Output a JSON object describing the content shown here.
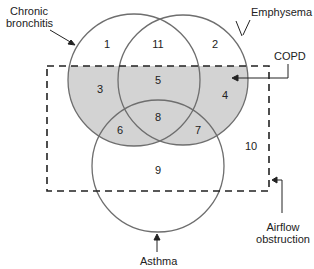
{
  "diagram": {
    "type": "venn",
    "sets": [
      {
        "name": "chronic-bronchitis",
        "label_line1": "Chronic",
        "label_line2": "bronchitis"
      },
      {
        "name": "emphysema",
        "label": "Emphysema"
      },
      {
        "name": "asthma",
        "label": "Asthma"
      }
    ],
    "labels": {
      "chronic_l1": "Chronic",
      "chronic_l2": "bronchitis",
      "emphysema": "Emphysema",
      "copd": "COPD",
      "airflow_l1": "Airflow",
      "airflow_l2": "obstruction",
      "asthma": "Asthma"
    },
    "regions": [
      "1",
      "2",
      "3",
      "4",
      "5",
      "6",
      "7",
      "8",
      "9",
      "10",
      "11"
    ],
    "colors": {
      "shaded": "#d3d3d3",
      "stroke": "#6e6e6e",
      "dash": "#222222"
    }
  }
}
